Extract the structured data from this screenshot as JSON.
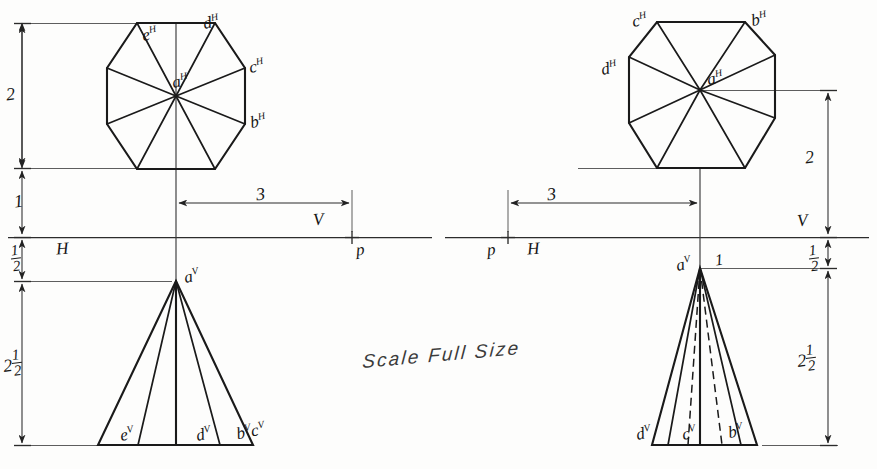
{
  "sheet": {
    "width": 877,
    "height": 469,
    "background": "#fdfdfc",
    "ink": "#1a1a1a",
    "note": "Scale Full Size"
  },
  "left_view": {
    "name": "octagonal-pyramid-axis-vertical",
    "top_view": {
      "center_label": "a",
      "center_superscript": "H",
      "vertex_labels": [
        {
          "id": "e",
          "sup": "H"
        },
        {
          "id": "d",
          "sup": "H"
        },
        {
          "id": "c",
          "sup": "H"
        },
        {
          "id": "b",
          "sup": "H"
        }
      ]
    },
    "front_view": {
      "apex_label": "a",
      "apex_superscript": "V",
      "base_labels": [
        {
          "id": "e",
          "sup": "V"
        },
        {
          "id": "d",
          "sup": "V"
        },
        {
          "id": "b",
          "sup": "V"
        },
        {
          "id": "c",
          "sup": "V"
        }
      ],
      "base_label_combined": "bc"
    },
    "planes": {
      "horizontal": "H",
      "vertical": "V",
      "point": "p"
    },
    "dimensions": [
      {
        "id": "left-dim-2",
        "value": "2"
      },
      {
        "id": "left-dim-1",
        "value": "1"
      },
      {
        "id": "left-dim-half",
        "value": "1/2",
        "numerator": "1",
        "denominator": "2"
      },
      {
        "id": "left-dim-2half",
        "value": "2 1/2",
        "whole": "2",
        "numerator": "1",
        "denominator": "2"
      },
      {
        "id": "left-dim-3",
        "value": "3"
      }
    ]
  },
  "right_view": {
    "name": "octagonal-pyramid-axis-inclined",
    "top_view": {
      "center_label": "a",
      "center_superscript": "H",
      "vertex_labels": [
        {
          "id": "c",
          "sup": "H"
        },
        {
          "id": "b",
          "sup": "H"
        },
        {
          "id": "d",
          "sup": "H"
        }
      ]
    },
    "front_view": {
      "apex_label": "a",
      "apex_superscript": "V",
      "apex_note": "1",
      "base_labels": [
        {
          "id": "d",
          "sup": "V"
        },
        {
          "id": "c",
          "sup": "V"
        },
        {
          "id": "b",
          "sup": "V"
        }
      ]
    },
    "planes": {
      "horizontal": "H",
      "vertical": "V",
      "point": "p"
    },
    "dimensions": [
      {
        "id": "right-dim-2",
        "value": "2"
      },
      {
        "id": "right-dim-half",
        "value": "1/2",
        "numerator": "1",
        "denominator": "2"
      },
      {
        "id": "right-dim-2half",
        "value": "2 1/2",
        "whole": "2",
        "numerator": "1",
        "denominator": "2"
      },
      {
        "id": "right-dim-3",
        "value": "3"
      }
    ]
  }
}
